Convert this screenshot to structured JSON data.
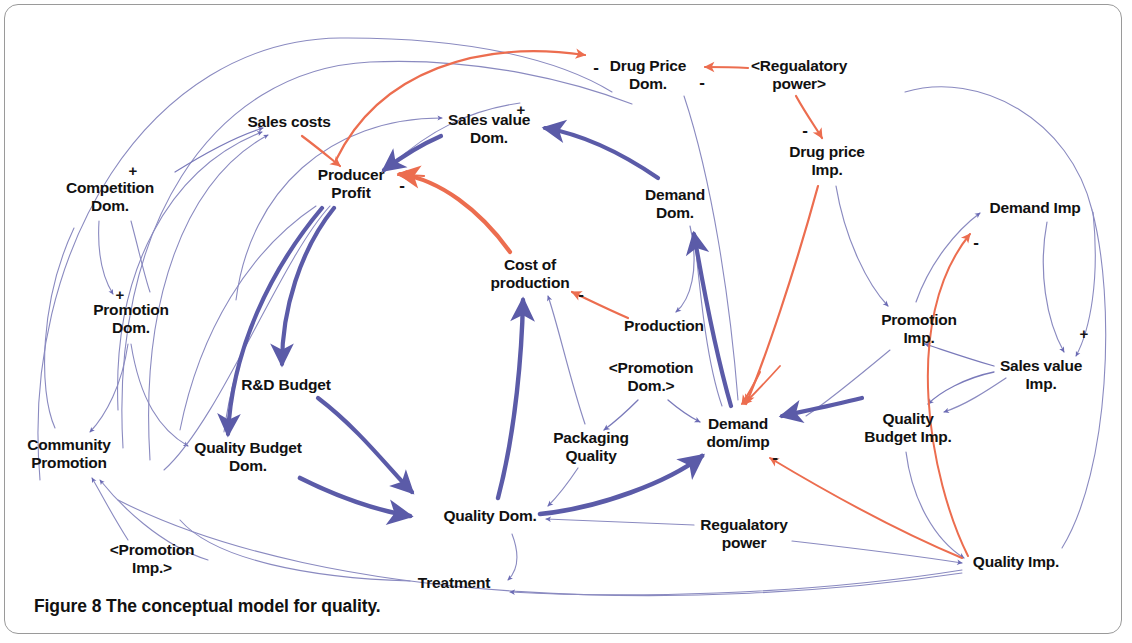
{
  "figure": {
    "caption_label": "Figure 8",
    "caption_text": "The conceptual model for quality.",
    "border_color": "#9a9a9a",
    "background": "#ffffff"
  },
  "colors": {
    "link_blue": "#5b5ba8",
    "link_blue_thin": "#8a8ac0",
    "link_orange": "#ec6d4f",
    "text": "#111111"
  },
  "nodes": [
    {
      "id": "competition-dom",
      "label": "Competition\nDom.",
      "x": 110,
      "y": 196
    },
    {
      "id": "sales-costs",
      "label": "Sales costs",
      "x": 289,
      "y": 122
    },
    {
      "id": "producer-profit",
      "label": "Producer\nProfit",
      "x": 351,
      "y": 183
    },
    {
      "id": "sales-value-dom",
      "label": "Sales value\nDom.",
      "x": 489,
      "y": 128
    },
    {
      "id": "drug-price-dom",
      "label": "Drug Price\nDom.",
      "x": 648,
      "y": 74
    },
    {
      "id": "regulatory-power-ref",
      "label": "<Regualatory\npower>",
      "x": 799,
      "y": 74
    },
    {
      "id": "drug-price-imp",
      "label": "Drug price\nImp.",
      "x": 827,
      "y": 160
    },
    {
      "id": "demand-dom",
      "label": "Demand\nDom.",
      "x": 675,
      "y": 203
    },
    {
      "id": "demand-imp",
      "label": "Demand Imp",
      "x": 1035,
      "y": 208
    },
    {
      "id": "promotion-dom",
      "label": "Promotion\nDom.",
      "x": 131,
      "y": 318
    },
    {
      "id": "cost-of-production",
      "label": "Cost of\nproduction",
      "x": 530,
      "y": 273
    },
    {
      "id": "production",
      "label": "Production",
      "x": 664,
      "y": 326
    },
    {
      "id": "promotion-imp",
      "label": "Promotion\nImp.",
      "x": 919,
      "y": 328
    },
    {
      "id": "sales-value-imp",
      "label": "Sales value\nImp.",
      "x": 1041,
      "y": 374
    },
    {
      "id": "rd-budget",
      "label": "R&D Budget",
      "x": 286,
      "y": 385
    },
    {
      "id": "promotion-dom-ref",
      "label": "<Promotion\nDom.>",
      "x": 651,
      "y": 376
    },
    {
      "id": "packaging-quality",
      "label": "Packaging\nQuality",
      "x": 591,
      "y": 446
    },
    {
      "id": "demand-dom-imp",
      "label": "Demand\ndom/imp",
      "x": 738,
      "y": 432
    },
    {
      "id": "quality-budget-imp",
      "label": "Quality\nBudget Imp.",
      "x": 908,
      "y": 427
    },
    {
      "id": "quality-budget-dom",
      "label": "Quality Budget\nDom.",
      "x": 248,
      "y": 456
    },
    {
      "id": "community-promotion",
      "label": "Community\nPromotion",
      "x": 69,
      "y": 453
    },
    {
      "id": "quality-dom",
      "label": "Quality Dom.",
      "x": 490,
      "y": 516
    },
    {
      "id": "regulatory-power",
      "label": "Regualatory\npower",
      "x": 744,
      "y": 533
    },
    {
      "id": "quality-imp",
      "label": "Quality Imp.",
      "x": 1016,
      "y": 562
    },
    {
      "id": "promotion-imp-ref",
      "label": "<Promotion\nImp.>",
      "x": 152,
      "y": 558
    },
    {
      "id": "treatment",
      "label": "Treatment",
      "x": 454,
      "y": 583
    }
  ],
  "polarities": [
    {
      "id": "pol-drug-price-dom-left",
      "sign": "-",
      "x": 596,
      "y": 67
    },
    {
      "id": "pol-drug-price-dom-right",
      "sign": "-",
      "x": 702,
      "y": 82
    },
    {
      "id": "pol-sales-value-dom",
      "sign": "+",
      "x": 521,
      "y": 109
    },
    {
      "id": "pol-competition-dom",
      "sign": "+",
      "x": 133,
      "y": 170
    },
    {
      "id": "pol-producer-profit",
      "sign": "-",
      "x": 402,
      "y": 185
    },
    {
      "id": "pol-drug-price-imp",
      "sign": "-",
      "x": 805,
      "y": 130
    },
    {
      "id": "pol-demand-imp",
      "sign": "-",
      "x": 976,
      "y": 242
    },
    {
      "id": "pol-promotion-dom",
      "sign": "+",
      "x": 120,
      "y": 294
    },
    {
      "id": "pol-cost-of-production",
      "sign": "-",
      "x": 581,
      "y": 294
    },
    {
      "id": "pol-sales-value-imp",
      "sign": "+",
      "x": 1084,
      "y": 333
    },
    {
      "id": "pol-demand-dom-imp",
      "sign": "-",
      "x": 775,
      "y": 457
    }
  ],
  "links": [
    {
      "from": "regulatory-power-ref",
      "to": "drug-price-dom",
      "sign": "-",
      "color": "orange"
    },
    {
      "from": "regulatory-power-ref",
      "to": "drug-price-imp",
      "sign": "-",
      "color": "orange"
    },
    {
      "from": "producer-profit",
      "to": "drug-price-dom",
      "sign": "",
      "color": "orange"
    },
    {
      "from": "drug-price-dom",
      "to": "sales-value-dom",
      "sign": "+",
      "color": "blue"
    },
    {
      "from": "demand-dom",
      "to": "sales-value-dom",
      "sign": "",
      "color": "blue"
    },
    {
      "from": "sales-value-dom",
      "to": "producer-profit",
      "sign": "",
      "color": "blue"
    },
    {
      "from": "sales-costs",
      "to": "producer-profit",
      "sign": "",
      "color": "orange"
    },
    {
      "from": "cost-of-production",
      "to": "producer-profit",
      "sign": "-",
      "color": "orange"
    },
    {
      "from": "competition-dom",
      "to": "sales-costs",
      "sign": "+",
      "color": "blue"
    },
    {
      "from": "producer-profit",
      "to": "rd-budget",
      "sign": "",
      "color": "blue"
    },
    {
      "from": "producer-profit",
      "to": "quality-budget-dom",
      "sign": "",
      "color": "blue"
    },
    {
      "from": "rd-budget",
      "to": "quality-dom",
      "sign": "",
      "color": "blue"
    },
    {
      "from": "quality-budget-dom",
      "to": "quality-dom",
      "sign": "",
      "color": "blue"
    },
    {
      "from": "quality-dom",
      "to": "cost-of-production",
      "sign": "",
      "color": "blue"
    },
    {
      "from": "quality-dom",
      "to": "demand-dom-imp",
      "sign": "",
      "color": "blue"
    },
    {
      "from": "packaging-quality",
      "to": "cost-of-production",
      "sign": "",
      "color": "blue"
    },
    {
      "from": "packaging-quality",
      "to": "quality-dom",
      "sign": "",
      "color": "blue"
    },
    {
      "from": "promotion-dom-ref",
      "to": "packaging-quality",
      "sign": "",
      "color": "blue"
    },
    {
      "from": "promotion-dom-ref",
      "to": "demand-dom-imp",
      "sign": "",
      "color": "blue"
    },
    {
      "from": "demand-dom-imp",
      "to": "demand-dom",
      "sign": "",
      "color": "blue"
    },
    {
      "from": "demand-dom-imp",
      "to": "demand-imp",
      "sign": "",
      "color": "blue"
    },
    {
      "from": "demand-dom",
      "to": "production",
      "sign": "",
      "color": "blue"
    },
    {
      "from": "production",
      "to": "cost-of-production",
      "sign": "",
      "color": "orange"
    },
    {
      "from": "drug-price-imp",
      "to": "demand-dom-imp",
      "sign": "",
      "color": "orange"
    },
    {
      "from": "promotion-imp",
      "to": "demand-imp",
      "sign": "",
      "color": "blue"
    },
    {
      "from": "sales-value-imp",
      "to": "promotion-imp",
      "sign": "",
      "color": "blue"
    },
    {
      "from": "sales-value-imp",
      "to": "quality-budget-imp",
      "sign": "",
      "color": "blue"
    },
    {
      "from": "demand-imp",
      "to": "sales-value-imp",
      "sign": "+",
      "color": "blue"
    },
    {
      "from": "quality-budget-imp",
      "to": "quality-imp",
      "sign": "",
      "color": "blue"
    },
    {
      "from": "quality-imp",
      "to": "demand-dom-imp",
      "sign": "-",
      "color": "orange"
    },
    {
      "from": "regulatory-power",
      "to": "quality-imp",
      "sign": "",
      "color": "blue"
    },
    {
      "from": "regulatory-power",
      "to": "quality-dom",
      "sign": "",
      "color": "blue"
    },
    {
      "from": "quality-dom",
      "to": "treatment",
      "sign": "",
      "color": "blue"
    },
    {
      "from": "quality-imp",
      "to": "treatment",
      "sign": "",
      "color": "blue"
    },
    {
      "from": "promotion-dom",
      "to": "community-promotion",
      "sign": "",
      "color": "blue"
    },
    {
      "from": "promotion-dom",
      "to": "quality-budget-dom",
      "sign": "",
      "color": "blue"
    },
    {
      "from": "promotion-imp-ref",
      "to": "community-promotion",
      "sign": "",
      "color": "blue"
    },
    {
      "from": "competition-dom",
      "to": "promotion-dom",
      "sign": "+",
      "color": "blue"
    }
  ]
}
